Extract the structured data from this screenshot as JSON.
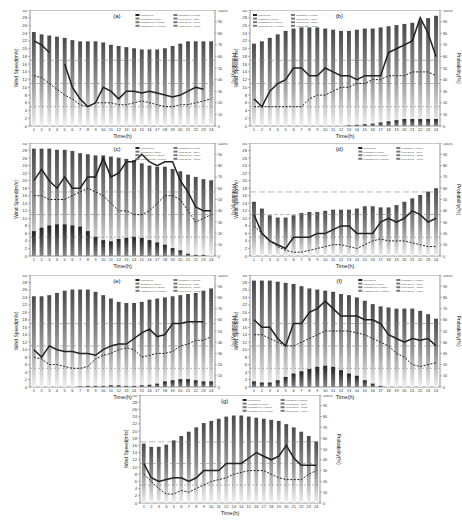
{
  "figure": {
    "xlabel": "Time(h)",
    "ylabel_left": "Wind Speed(m/s)",
    "ylabel_right": "Probability(%)",
    "left_ticks": [
      0,
      2,
      4,
      6,
      8,
      10,
      12,
      14,
      16,
      18,
      20,
      22,
      24,
      26,
      28,
      30
    ],
    "right_ticks": [
      "0",
      "10",
      "20",
      "30",
      "40",
      "50",
      "60",
      "70",
      "80",
      "90",
      "100%"
    ],
    "x_ticks": [
      1,
      2,
      3,
      4,
      5,
      6,
      7,
      8,
      9,
      10,
      11,
      12,
      13,
      14,
      15,
      16,
      17,
      18,
      19,
      20,
      21,
      22,
      23,
      24
    ],
    "threshold_lines_ms": [
      5,
      11,
      17
    ],
    "legend": [
      "Wind speed",
      "Probability(v<5m/s)",
      "Probability(5<v<11m/s)",
      "Probability(11<v<17m/s)",
      "Probability(v>17m/s)",
      "Wind speed = 5m/s",
      "Wind speed = 11m/s",
      "Wind speed = 17m/s"
    ]
  },
  "chart_data": [
    {
      "panel": "(a)",
      "type": "bar+line",
      "x": [
        1,
        2,
        3,
        4,
        5,
        6,
        7,
        8,
        9,
        10,
        11,
        12,
        13,
        14,
        15,
        16,
        17,
        18,
        19,
        20,
        21,
        22,
        23,
        24
      ],
      "xlabel": "Time(h)",
      "ylabel": "Wind Speed(m/s)",
      "y2label": "Probability(%)",
      "ylim": [
        0,
        30
      ],
      "y2lim": [
        0,
        100
      ],
      "series": [
        {
          "name": "Probability bars (%)",
          "values": [
            81,
            79,
            78,
            77,
            76,
            74,
            73,
            73,
            73,
            72,
            70,
            69,
            68,
            67,
            66,
            66,
            66,
            67,
            69,
            71,
            73,
            73,
            73,
            73
          ]
        },
        {
          "name": "Wind speed (solid)",
          "values": [
            22,
            21,
            19,
            null,
            16,
            10,
            7,
            5,
            6,
            10,
            9,
            7,
            9,
            9,
            8.5,
            9,
            8.5,
            8,
            7.5,
            8,
            9,
            10,
            9.5,
            null
          ]
        },
        {
          "name": "Wind speed (dashed)",
          "values": [
            13,
            12.5,
            11,
            9.5,
            8,
            7,
            5.5,
            5,
            6,
            6,
            6,
            5.5,
            5.5,
            6,
            6.5,
            6,
            5.5,
            5,
            5,
            5.5,
            5.5,
            6,
            6.5,
            7
          ]
        }
      ]
    },
    {
      "panel": "(b)",
      "type": "bar+line",
      "x": [
        1,
        2,
        3,
        4,
        5,
        6,
        7,
        8,
        9,
        10,
        11,
        12,
        13,
        14,
        15,
        16,
        17,
        18,
        19,
        20,
        21,
        22,
        23,
        24
      ],
      "ylim": [
        0,
        30
      ],
      "y2lim": [
        0,
        100
      ],
      "series": [
        {
          "name": "Probability bars (%)",
          "values": [
            71,
            73,
            76,
            79,
            82,
            84,
            85,
            85,
            85,
            84,
            83,
            82,
            82,
            83,
            84,
            84,
            85,
            86,
            87,
            88,
            89,
            91,
            93,
            95
          ]
        },
        {
          "name": "Low-probability bars (%)",
          "values": [
            0,
            0,
            0,
            0,
            0,
            0,
            0,
            0,
            0,
            0,
            0,
            0,
            0.5,
            1,
            1.5,
            2,
            3,
            4,
            5,
            6,
            6,
            6,
            6,
            6
          ]
        },
        {
          "name": "Wind speed (solid)",
          "values": [
            7,
            5,
            9,
            11,
            12,
            15,
            15,
            13,
            13,
            15,
            14,
            13,
            13,
            12,
            13,
            13,
            13,
            19,
            20,
            21,
            22,
            28,
            24,
            18
          ]
        },
        {
          "name": "Wind speed (dashed)",
          "values": [
            5,
            5,
            5,
            5,
            5,
            5,
            5,
            7,
            8,
            8,
            9,
            10,
            10,
            11,
            11,
            12,
            12,
            13,
            13,
            13,
            14,
            14,
            14,
            13
          ]
        }
      ]
    },
    {
      "panel": "(c)",
      "type": "bar+line",
      "x": [
        1,
        2,
        3,
        4,
        5,
        6,
        7,
        8,
        9,
        10,
        11,
        12,
        13,
        14,
        15,
        16,
        17,
        18,
        19,
        20,
        21,
        22,
        23,
        24
      ],
      "ylim": [
        0,
        30
      ],
      "y2lim": [
        0,
        100
      ],
      "series": [
        {
          "name": "Probability bars (%)",
          "values": [
            95,
            95,
            95,
            94,
            94,
            93,
            91,
            90,
            89,
            89,
            88,
            87,
            86,
            85,
            82,
            80,
            79,
            79,
            77,
            75,
            72,
            70,
            68,
            67
          ]
        },
        {
          "name": "Low-probability bars (%)",
          "values": [
            22,
            25,
            27,
            28,
            28,
            27,
            26,
            22,
            17,
            14,
            13,
            15,
            16,
            17,
            16,
            14,
            12,
            10,
            7,
            5,
            2,
            1,
            1,
            0
          ]
        },
        {
          "name": "Wind speed (solid)",
          "values": [
            20,
            23,
            20,
            18,
            21,
            18,
            18,
            21,
            21,
            26,
            21,
            22,
            25,
            25,
            27,
            25,
            24,
            25,
            25,
            20,
            17,
            13,
            12,
            12
          ]
        },
        {
          "name": "Wind speed (dashed)",
          "values": [
            16,
            16,
            15,
            15,
            15,
            16,
            17,
            18,
            17,
            16,
            14,
            12,
            12,
            11,
            11,
            12,
            14,
            16,
            16,
            15,
            12,
            9,
            10,
            11
          ]
        }
      ]
    },
    {
      "panel": "(d)",
      "type": "bar+line",
      "x": [
        1,
        2,
        3,
        4,
        5,
        6,
        7,
        8,
        9,
        10,
        11,
        12,
        13,
        14,
        15,
        16,
        17,
        18,
        19,
        20,
        21,
        22,
        23,
        24
      ],
      "ylim": [
        0,
        30
      ],
      "y2lim": [
        0,
        100
      ],
      "series": [
        {
          "name": "Probability bars (%)",
          "values": [
            48,
            42,
            36,
            34,
            34,
            36,
            38,
            39,
            39,
            40,
            41,
            41,
            41,
            42,
            44,
            44,
            43,
            43,
            45,
            48,
            51,
            54,
            57,
            60
          ]
        },
        {
          "name": "Wind speed (solid)",
          "values": [
            11,
            6,
            4,
            3,
            2,
            5,
            5,
            5,
            6,
            6,
            7,
            8,
            8,
            6,
            6,
            6,
            9,
            10,
            9,
            10,
            12,
            11,
            9,
            10
          ]
        },
        {
          "name": "Wind speed (dashed)",
          "values": [
            8,
            6,
            4,
            2.5,
            1.5,
            1,
            1,
            1.5,
            2,
            2.5,
            3,
            3,
            2.5,
            2,
            3,
            4,
            4.5,
            4,
            4,
            4,
            3.5,
            3,
            2.5,
            2.5
          ]
        }
      ]
    },
    {
      "panel": "(e)",
      "type": "bar+line",
      "x": [
        1,
        2,
        3,
        4,
        5,
        6,
        7,
        8,
        9,
        10,
        11,
        12,
        13,
        14,
        15,
        16,
        17,
        18,
        19,
        20,
        21,
        22,
        23,
        24
      ],
      "ylim": [
        0,
        30
      ],
      "y2lim": [
        0,
        100
      ],
      "series": [
        {
          "name": "Probability bars (%)",
          "values": [
            81,
            81,
            82,
            84,
            86,
            87,
            87,
            87,
            85,
            82,
            79,
            76,
            75,
            75,
            76,
            78,
            79,
            80,
            81,
            82,
            83,
            84,
            86,
            88
          ]
        },
        {
          "name": "Low-probability bars (%)",
          "values": [
            0,
            0,
            0,
            0,
            0,
            0,
            0.5,
            1,
            1,
            1,
            1.5,
            1.5,
            1,
            1,
            1.5,
            2,
            3,
            5,
            6,
            7,
            7,
            6,
            5,
            5
          ]
        },
        {
          "name": "Wind speed (solid)",
          "values": [
            10,
            8,
            11,
            10,
            9.5,
            9.5,
            9,
            9,
            8.5,
            10,
            11,
            11.5,
            11.5,
            13,
            14.5,
            15.5,
            13.5,
            14,
            17,
            17,
            17.5,
            17.5,
            17.5,
            null
          ]
        },
        {
          "name": "Wind speed (dashed)",
          "values": [
            8,
            7.5,
            6,
            6,
            5.5,
            5,
            5,
            5.5,
            7.5,
            8.5,
            9,
            10,
            10.5,
            10,
            8,
            8.5,
            9,
            9,
            9.5,
            11,
            11.5,
            12.5,
            12.5,
            13.5
          ]
        }
      ]
    },
    {
      "panel": "(f)",
      "type": "bar+line",
      "x": [
        1,
        2,
        3,
        4,
        5,
        6,
        7,
        8,
        9,
        10,
        11,
        12,
        13,
        14,
        15,
        16,
        17,
        18,
        19,
        20,
        21,
        22,
        23,
        24
      ],
      "ylim": [
        0,
        30
      ],
      "y2lim": [
        0,
        100
      ],
      "series": [
        {
          "name": "Probability bars (%)",
          "values": [
            95,
            95,
            95,
            94,
            93,
            92,
            90,
            88,
            87,
            86,
            85,
            83,
            82,
            80,
            77,
            74,
            72,
            71,
            70,
            70,
            70,
            68,
            65,
            61
          ]
        },
        {
          "name": "Low-probability bars (%)",
          "values": [
            5,
            4,
            4,
            6,
            9,
            12,
            14,
            16,
            18,
            19,
            18,
            15,
            12,
            10,
            6,
            3,
            1,
            0,
            0,
            0,
            0,
            0,
            0,
            0
          ]
        },
        {
          "name": "Wind speed (solid)",
          "values": [
            18,
            16,
            16,
            13,
            11,
            17,
            17,
            20,
            21,
            23,
            21,
            19,
            19,
            19,
            18,
            18,
            17,
            14,
            13,
            12,
            13,
            12.5,
            13,
            11
          ]
        },
        {
          "name": "Wind speed (dashed)",
          "values": [
            14,
            14,
            13,
            12,
            11,
            11,
            12,
            13,
            14,
            15,
            15,
            15,
            15,
            14.5,
            14,
            13,
            12,
            11,
            9,
            8,
            6,
            5.5,
            6,
            6.5
          ]
        }
      ]
    },
    {
      "panel": "(g)",
      "type": "bar+line",
      "x": [
        1,
        2,
        3,
        4,
        5,
        6,
        7,
        8,
        9,
        10,
        11,
        12,
        13,
        14,
        15,
        16,
        17,
        18,
        19,
        20,
        21,
        22,
        23,
        24
      ],
      "ylim": [
        0,
        30
      ],
      "y2lim": [
        0,
        100
      ],
      "series": [
        {
          "name": "Probability bars (%)",
          "values": [
            55,
            52,
            52,
            54,
            58,
            62,
            66,
            70,
            74,
            76,
            78,
            80,
            81,
            81,
            80,
            79,
            78,
            77,
            76,
            73,
            70,
            66,
            62,
            57
          ]
        },
        {
          "name": "Wind speed (solid)",
          "values": [
            11,
            7,
            6,
            6.5,
            7,
            7,
            6,
            7,
            9,
            9,
            9,
            11,
            11,
            11,
            12.5,
            14,
            13,
            12,
            13,
            16,
            12.5,
            10.5,
            10.5,
            10.5
          ]
        },
        {
          "name": "Wind speed (dashed)",
          "values": [
            8,
            6,
            4,
            2.5,
            2.5,
            3.5,
            3,
            4,
            5,
            6,
            6.5,
            7,
            8,
            8.5,
            9,
            9,
            9,
            8,
            7,
            6.5,
            6.5,
            6.5,
            8,
            9
          ]
        }
      ]
    }
  ],
  "panels": [
    {
      "label": "(a)",
      "x": 30,
      "y": 10,
      "w": 185,
      "h": 116,
      "legend": "topright"
    },
    {
      "label": "(b)",
      "x": 250,
      "y": 10,
      "w": 190,
      "h": 116,
      "legend": "topleft"
    },
    {
      "label": "(c)",
      "x": 30,
      "y": 143,
      "w": 185,
      "h": 113,
      "legend": "topright"
    },
    {
      "label": "(d)",
      "x": 250,
      "y": 143,
      "w": 190,
      "h": 113,
      "legend": "topright"
    },
    {
      "label": "(e)",
      "x": 30,
      "y": 275,
      "w": 185,
      "h": 112,
      "legend": "topright"
    },
    {
      "label": "(f)",
      "x": 250,
      "y": 275,
      "w": 190,
      "h": 112,
      "legend": "topright"
    },
    {
      "label": "(g)",
      "x": 140,
      "y": 395,
      "w": 180,
      "h": 108,
      "legend": "topright"
    }
  ]
}
